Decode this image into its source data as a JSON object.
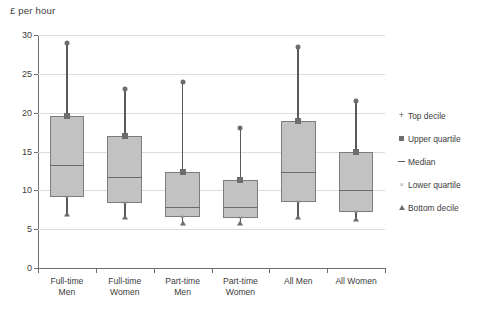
{
  "chart_data": {
    "type": "box",
    "title": "",
    "ylabel": "£ per hour",
    "xlabel": "",
    "ylim": [
      0,
      30
    ],
    "yticks": [
      0,
      5,
      10,
      15,
      20,
      25,
      30
    ],
    "grid": true,
    "legend_position": "right",
    "categories": [
      "Full-time Men",
      "Full-time Women",
      "Part-time Men",
      "Part-time Women",
      "All Men",
      "All Women"
    ],
    "category_lines": [
      [
        "Full-time",
        "Men"
      ],
      [
        "Full-time",
        "Women"
      ],
      [
        "Part-time",
        "Men"
      ],
      [
        "Part-time",
        "Women"
      ],
      [
        "All Men",
        ""
      ],
      [
        "All Women",
        ""
      ]
    ],
    "series": [
      {
        "name": "Bottom decile",
        "values": [
          7.0,
          6.6,
          5.8,
          5.8,
          6.6,
          6.3
        ]
      },
      {
        "name": "Lower quartile",
        "values": [
          9.2,
          8.4,
          6.6,
          6.5,
          8.5,
          7.2
        ]
      },
      {
        "name": "Median",
        "values": [
          13.2,
          11.7,
          7.8,
          7.8,
          12.3,
          10.0
        ]
      },
      {
        "name": "Upper quartile",
        "values": [
          19.6,
          17.0,
          12.4,
          11.3,
          18.9,
          15.0
        ]
      },
      {
        "name": "Top decile",
        "values": [
          29.0,
          23.0,
          24.0,
          18.0,
          28.5,
          21.5
        ]
      }
    ],
    "legend": [
      {
        "label": "Top decile",
        "symbol": "plus-marker",
        "color": "#5a5a5a"
      },
      {
        "label": "Upper quartile",
        "symbol": "square-marker",
        "color": "#6d6d6d"
      },
      {
        "label": "Median",
        "symbol": "dash-marker",
        "color": "#5a5a5a"
      },
      {
        "label": "Lower quartile",
        "symbol": "cross-marker",
        "color": "#a5a5a5"
      },
      {
        "label": "Bottom decile",
        "symbol": "triangle-marker",
        "color": "#6d6d6d"
      }
    ],
    "colors": {
      "box_fill": "#c2c2c2",
      "box_border": "#7d7d7d",
      "whisker": "#5a5a5a",
      "gridline": "#dcdcdc",
      "axis": "#6e6e6e",
      "text": "#3c3c3c",
      "background": "#ffffff"
    }
  }
}
